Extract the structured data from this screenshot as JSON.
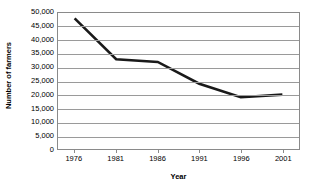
{
  "chart_data": {
    "type": "line",
    "title": "",
    "xlabel": "Year",
    "ylabel": "Number of farmers",
    "categories": [
      "1976",
      "1981",
      "1986",
      "1991",
      "1996",
      "2001"
    ],
    "x": [
      1976,
      1981,
      1986,
      1991,
      1996,
      2001
    ],
    "values": [
      48000,
      33000,
      32000,
      24000,
      19000,
      20000
    ],
    "series": [
      {
        "name": "Number of farmers",
        "values": [
          48000,
          33000,
          32000,
          24000,
          19000,
          20000
        ]
      }
    ],
    "ylim": [
      0,
      50000
    ],
    "xlim": [
      1974,
      2003
    ],
    "y_ticks": [
      0,
      5000,
      10000,
      15000,
      20000,
      25000,
      30000,
      35000,
      40000,
      45000,
      50000
    ],
    "y_tick_labels": [
      "0",
      "5,000",
      "10,000",
      "15,000",
      "20,000",
      "25,000",
      "30,000",
      "35,000",
      "40,000",
      "45,000",
      "50,000"
    ],
    "x_tick_labels": [
      "1976",
      "1981",
      "1986",
      "1991",
      "1996",
      "2001"
    ],
    "grid": true,
    "grid_axis": "y",
    "legend": false,
    "legend_position": "none",
    "line_color": "#1a1a1a",
    "line_width": 2.6,
    "gridline_color": "#9a9a9a",
    "frame_color": "#8a8a8a",
    "background_color": "#ffffff",
    "markers": false
  }
}
